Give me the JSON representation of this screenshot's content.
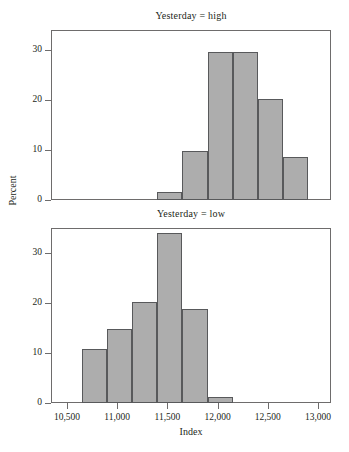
{
  "figure": {
    "width": 349,
    "height": 452,
    "background": "#ffffff",
    "bar_fill": "#adadad",
    "bar_stroke": "#58595b",
    "axis_color": "#6e6c6c",
    "text_color": "#231f20"
  },
  "axes": {
    "xlabel": "Index",
    "ylabel": "Percent",
    "x_ticks": [
      "10,500",
      "11,000",
      "11,500",
      "12,000",
      "12,500",
      "13,000"
    ],
    "x_tick_values": [
      10500,
      11000,
      11500,
      12000,
      12500,
      13000
    ],
    "y_ticks": [
      "0",
      "10",
      "20",
      "30"
    ],
    "y_tick_values": [
      0,
      10,
      20,
      30
    ]
  },
  "panels": [
    {
      "title": "Yesterday = high"
    },
    {
      "title": "Yesterday = low"
    }
  ],
  "chart_data": [
    {
      "type": "bar",
      "title": "Yesterday = high",
      "xlabel": "Index",
      "ylabel": "Percent",
      "xlim": [
        10350,
        13140
      ],
      "ylim": [
        0,
        34
      ],
      "grid": false,
      "legend": null,
      "bin_width": 250,
      "bin_edges": [
        11400,
        11650,
        11900,
        12150,
        12400,
        12650,
        12900
      ],
      "bin_centers": [
        11525,
        11775,
        12025,
        12275,
        12525,
        12775
      ],
      "values": [
        1.6,
        9.8,
        29.6,
        29.6,
        20.3,
        8.7
      ],
      "categories": [
        "11400-11650",
        "11650-11900",
        "11900-12150",
        "12150-12400",
        "12400-12650",
        "12650-12900"
      ]
    },
    {
      "type": "bar",
      "title": "Yesterday = low",
      "xlabel": "Index",
      "ylabel": "Percent",
      "xlim": [
        10350,
        13140
      ],
      "ylim": [
        0,
        35
      ],
      "grid": false,
      "legend": null,
      "bin_width": 250,
      "bin_edges": [
        10650,
        10900,
        11150,
        11400,
        11650,
        11900,
        12150
      ],
      "bin_centers": [
        10775,
        11025,
        11275,
        11525,
        11775,
        12025
      ],
      "values": [
        10.8,
        14.8,
        20.2,
        34.0,
        18.8,
        1.3
      ],
      "categories": [
        "10650-10900",
        "10900-11150",
        "11150-11400",
        "11400-11650",
        "11650-11900",
        "11900-12150"
      ]
    }
  ]
}
